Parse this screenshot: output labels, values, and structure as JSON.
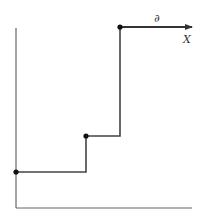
{
  "diagram": {
    "type": "step-function",
    "labels": {
      "arrow_label": "∂",
      "axis_label": "X"
    },
    "colors": {
      "line": "#333333",
      "axis": "#666666",
      "background": "#ffffff"
    },
    "points": [
      {
        "x": 16,
        "y": 172
      },
      {
        "x": 86,
        "y": 136
      },
      {
        "x": 120,
        "y": 27
      }
    ]
  }
}
